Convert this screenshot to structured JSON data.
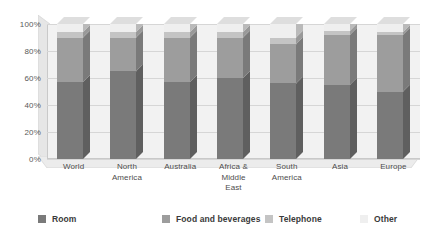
{
  "chart_data": {
    "type": "bar",
    "stacked": true,
    "stack_mode": "percent",
    "title": "",
    "subtitle": "",
    "xlabel": "",
    "ylabel": "",
    "ylim": [
      0,
      100
    ],
    "ytick_labels": [
      "0%",
      "20%",
      "40%",
      "60%",
      "80%",
      "100%"
    ],
    "ytick_values": [
      0,
      20,
      40,
      60,
      80,
      100
    ],
    "grid": true,
    "legend_position": "bottom",
    "categories": [
      "World",
      "North America",
      "Australia",
      "Africa & Middle East",
      "South America",
      "Asia",
      "Europe"
    ],
    "category_lines": [
      [
        "World"
      ],
      [
        "North",
        "America"
      ],
      [
        "Australia"
      ],
      [
        "Africa &",
        "Middle",
        "East"
      ],
      [
        "South",
        "America"
      ],
      [
        "Asia"
      ],
      [
        "Europe"
      ]
    ],
    "series": [
      {
        "name": "Room",
        "color": "#7a7a7a",
        "values": [
          57,
          65,
          57,
          60,
          56,
          55,
          50
        ]
      },
      {
        "name": "Food and beverages",
        "color": "#9d9d9d",
        "values": [
          33,
          25,
          33,
          30,
          29,
          37,
          42
        ]
      },
      {
        "name": "Telephone",
        "color": "#c4c4c4",
        "values": [
          4,
          4,
          4,
          4,
          5,
          3,
          2
        ]
      },
      {
        "name": "Other",
        "color": "#efefef",
        "values": [
          6,
          6,
          6,
          6,
          10,
          5,
          6
        ]
      }
    ],
    "annotations": []
  },
  "legend": {
    "items": [
      {
        "label": "Room",
        "color": "#7a7a7a"
      },
      {
        "label": "Food and beverages",
        "color": "#9d9d9d"
      },
      {
        "label": "Telephone",
        "color": "#c4c4c4"
      },
      {
        "label": "Other",
        "color": "#efefef"
      }
    ]
  },
  "colors": {
    "plot_background": "#f2f2f2",
    "gridline": "#d6d6d6",
    "axis_text": "#595959",
    "category_text": "#4d4d4d",
    "legend_text": "#3a3a3a",
    "wall_side": "#e2e2e2",
    "wall_floor": "#e8e8e8",
    "page_background": "#ffffff"
  }
}
